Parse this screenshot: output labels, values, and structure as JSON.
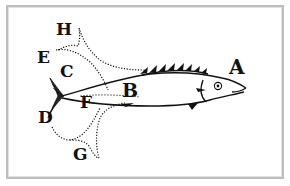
{
  "figure": {
    "colors": {
      "ink": "#111111",
      "frame": "#bdbdbd",
      "background": "#ffffff"
    },
    "labels": [
      {
        "id": "A",
        "text": "A",
        "x": 229,
        "y": 58,
        "size": 20
      },
      {
        "id": "B",
        "text": "B",
        "x": 122,
        "y": 81,
        "size": 19
      },
      {
        "id": "C",
        "text": "C",
        "x": 59,
        "y": 63,
        "size": 17
      },
      {
        "id": "D",
        "text": "D",
        "x": 38,
        "y": 109,
        "size": 17
      },
      {
        "id": "E",
        "text": "E",
        "x": 36,
        "y": 49,
        "size": 17
      },
      {
        "id": "F",
        "text": "F",
        "x": 79,
        "y": 94,
        "size": 17
      },
      {
        "id": "G",
        "text": "G",
        "x": 73,
        "y": 146,
        "size": 17
      },
      {
        "id": "H",
        "text": "H",
        "x": 56,
        "y": 21,
        "size": 17
      }
    ]
  }
}
